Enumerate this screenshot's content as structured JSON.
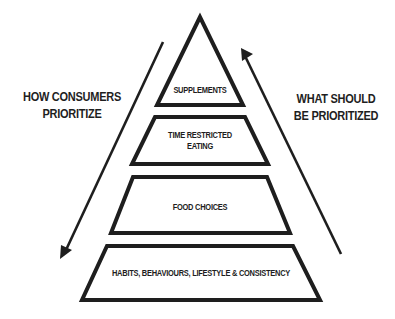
{
  "left_label": {
    "line1": "HOW CONSUMERS",
    "line2": "PRIORITIZE"
  },
  "right_label": {
    "line1": "WHAT SHOULD",
    "line2": "BE PRIORITIZED"
  },
  "tiers": [
    {
      "line1": "SUPPLEMENTS",
      "line2": ""
    },
    {
      "line1": "TIME RESTRICTED",
      "line2": "EATING"
    },
    {
      "line1": "FOOD CHOICES",
      "line2": ""
    },
    {
      "line1": "HABITS, BEHAVIOURS, LIFESTYLE & CONSISTENCY",
      "line2": ""
    }
  ],
  "arrows": {
    "left": {
      "direction": "down"
    },
    "right": {
      "direction": "up"
    }
  },
  "colors": {
    "stroke": "#1e1e1e",
    "background": "#ffffff"
  }
}
